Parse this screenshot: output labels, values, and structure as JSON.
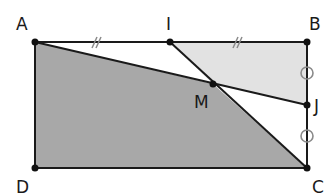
{
  "figure": {
    "type": "geometry",
    "shape": "rectangle ABCD",
    "points": {
      "A": {
        "label": "A",
        "x": 35,
        "y": 42
      },
      "I": {
        "label": "I",
        "x": 170,
        "y": 42
      },
      "B": {
        "label": "B",
        "x": 307,
        "y": 42
      },
      "M": {
        "label": "M",
        "x": 213,
        "y": 84
      },
      "J": {
        "label": "J",
        "x": 307,
        "y": 105
      },
      "C": {
        "label": "C",
        "x": 307,
        "y": 168
      },
      "D": {
        "label": "D",
        "x": 35,
        "y": 168
      }
    },
    "segments": [
      "AB",
      "BC",
      "CD",
      "DA",
      "AJ",
      "IC"
    ],
    "marks": {
      "equal_segments_slash": [
        "AI",
        "IB"
      ],
      "equal_segments_circle": [
        "BJ",
        "JC"
      ]
    },
    "shaded_regions": [
      {
        "name": "quadrilateral AMCD",
        "color": "#a8a8a8"
      },
      {
        "name": "quadrilateral IBJM",
        "color": "#e2e2e2"
      }
    ],
    "colors": {
      "line": "#1a1a1a",
      "dark_fill": "#a8a8a8",
      "light_fill": "#e2e2e2",
      "circle_mark": "#8a8a8a"
    }
  }
}
